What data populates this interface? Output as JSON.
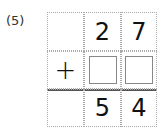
{
  "problem": {
    "label": "(5)",
    "operator": "+",
    "row1": [
      "",
      "2",
      "7"
    ],
    "row2_blanks": 2,
    "result": [
      "",
      "5",
      "4"
    ]
  }
}
